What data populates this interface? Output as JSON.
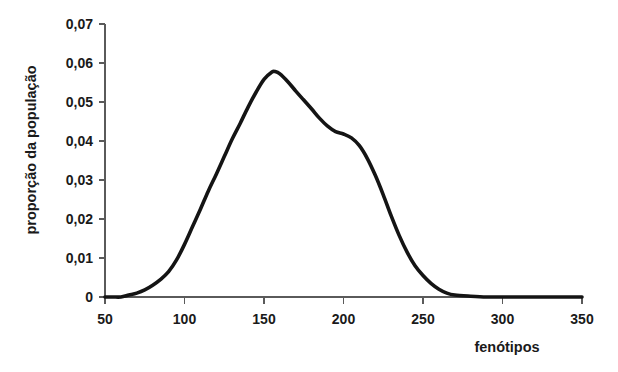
{
  "chart_data": {
    "type": "line",
    "title": "",
    "xlabel": "fenótipos",
    "ylabel": "proporção da população",
    "xlim": [
      50,
      350
    ],
    "ylim": [
      0,
      0.07
    ],
    "grid": false,
    "legend": "none",
    "x_ticks": [
      "50",
      "100",
      "150",
      "200",
      "250",
      "300",
      "350"
    ],
    "x_tick_values": [
      50,
      100,
      150,
      200,
      250,
      300,
      350
    ],
    "y_ticks": [
      "0",
      "0,01",
      "0,02",
      "0,03",
      "0,04",
      "0,05",
      "0,06",
      "0,07"
    ],
    "y_tick_values": [
      0,
      0.01,
      0.02,
      0.03,
      0.04,
      0.05,
      0.06,
      0.07
    ],
    "series": [
      {
        "name": "distribuição de fenótipos",
        "color": "#141414",
        "x": [
          50,
          55,
          60,
          65,
          70,
          75,
          80,
          85,
          90,
          95,
          100,
          105,
          110,
          115,
          120,
          125,
          130,
          135,
          140,
          145,
          150,
          155,
          157,
          160,
          165,
          170,
          175,
          180,
          185,
          190,
          195,
          200,
          205,
          210,
          215,
          220,
          225,
          230,
          235,
          240,
          245,
          250,
          255,
          260,
          265,
          270,
          280,
          290,
          300,
          310,
          320,
          330,
          340,
          350
        ],
        "y": [
          0.0,
          0.0,
          0.0,
          0.0005,
          0.001,
          0.0018,
          0.003,
          0.0045,
          0.0065,
          0.0095,
          0.0135,
          0.018,
          0.0225,
          0.0272,
          0.0315,
          0.036,
          0.0405,
          0.0445,
          0.0487,
          0.0525,
          0.0558,
          0.0577,
          0.0578,
          0.0572,
          0.0552,
          0.0528,
          0.0505,
          0.0482,
          0.0458,
          0.0438,
          0.0424,
          0.0418,
          0.0408,
          0.0388,
          0.0355,
          0.0312,
          0.0262,
          0.0208,
          0.0158,
          0.0115,
          0.008,
          0.0055,
          0.0035,
          0.002,
          0.001,
          0.0005,
          0.0002,
          0.0,
          0.0,
          0.0,
          0.0,
          0.0,
          0.0,
          0.0
        ]
      }
    ],
    "annotations": {
      "peak_x": 157,
      "peak_y": 0.058,
      "shoulder_x": 198,
      "shoulder_y": 0.042
    }
  }
}
